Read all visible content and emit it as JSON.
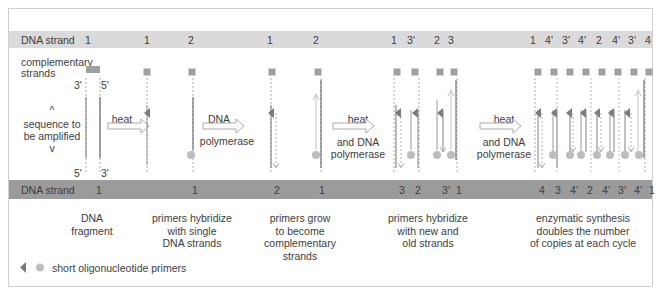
{
  "top_band": {
    "label": "DNA strand",
    "numbers": [
      {
        "x": 88,
        "text": "1"
      },
      {
        "x": 147,
        "text": "1"
      },
      {
        "x": 191,
        "text": "2"
      },
      {
        "x": 270,
        "text": "1"
      },
      {
        "x": 316,
        "text": "2"
      },
      {
        "x": 394,
        "text": "1"
      },
      {
        "x": 411,
        "text": "3'"
      },
      {
        "x": 437,
        "text": "2"
      },
      {
        "x": 451,
        "text": "3"
      },
      {
        "x": 533,
        "text": "1"
      },
      {
        "x": 549,
        "text": "4'"
      },
      {
        "x": 566,
        "text": "3'"
      },
      {
        "x": 582,
        "text": "4'"
      },
      {
        "x": 599,
        "text": "2"
      },
      {
        "x": 616,
        "text": "4'"
      },
      {
        "x": 632,
        "text": "3'"
      },
      {
        "x": 648,
        "text": "4"
      }
    ]
  },
  "bottom_band": {
    "label": "DNA strand",
    "numbers": [
      {
        "x": 99,
        "text": "1"
      },
      {
        "x": 195,
        "text": "1"
      },
      {
        "x": 277,
        "text": "2"
      },
      {
        "x": 322,
        "text": "1"
      },
      {
        "x": 402,
        "text": "3"
      },
      {
        "x": 418,
        "text": "2"
      },
      {
        "x": 446,
        "text": "3'"
      },
      {
        "x": 459,
        "text": "1"
      },
      {
        "x": 542,
        "text": "4"
      },
      {
        "x": 558,
        "text": "3"
      },
      {
        "x": 574,
        "text": "4'"
      },
      {
        "x": 590,
        "text": "2"
      },
      {
        "x": 606,
        "text": "4'"
      },
      {
        "x": 622,
        "text": "3'"
      },
      {
        "x": 638,
        "text": "4'"
      },
      {
        "x": 652,
        "text": "1"
      }
    ]
  },
  "left_labels": {
    "complementary_line1": "complementary",
    "complementary_line2": "strands",
    "up_caret": "^",
    "sequence_line1": "sequence to",
    "sequence_line2": "be amplified",
    "down_caret": "v",
    "end_3_top": "3'",
    "end_5_top": "5'",
    "end_5_bottom": "5'",
    "end_3_bottom": "3'"
  },
  "steps": [
    {
      "label_top": "heat",
      "label_bottom": ""
    },
    {
      "label_top": "DNA",
      "label_bottom": "polymerase"
    },
    {
      "label_top": "heat",
      "label_bottom": "and DNA polymerase"
    },
    {
      "label_top": "heat",
      "label_bottom": "and DNA polymerase"
    }
  ],
  "step_labels": {
    "s1_top": "heat",
    "s2_top": "DNA",
    "s2_bottom": "polymerase",
    "s3_top": "heat",
    "s3_bottom1": "and DNA",
    "s3_bottom2": "polymerase",
    "s4_top": "heat",
    "s4_bottom1": "and DNA",
    "s4_bottom2": "polymerase"
  },
  "captions": {
    "c1_line1": "DNA",
    "c1_line2": "fragment",
    "c2_line1": "primers hybridize",
    "c2_line2": "with single",
    "c2_line3": "DNA strands",
    "c3_line1": "primers grow",
    "c3_line2": "to become",
    "c3_line3": "complementary",
    "c3_line4": "strands",
    "c4_line1": "primers hybridize",
    "c4_line2": "with new and",
    "c4_line3": "old strands",
    "c5_line1": "enzymatic synthesis",
    "c5_line2": "doubles the number",
    "c5_line3": "of copies at each cycle"
  },
  "legend": {
    "text": "short oligonucleotide primers",
    "icons": [
      "triangle-primer",
      "circle-primer"
    ]
  },
  "colors": {
    "top_band": "#dadada",
    "bottom_band": "#9b9b9b",
    "strand": "#8c8c8c",
    "primer": "#7a7a7a",
    "circle_primer": "#b8b8b8",
    "square_marker": "#a0a0a0",
    "arrow_outline": "#9a9a9a"
  }
}
